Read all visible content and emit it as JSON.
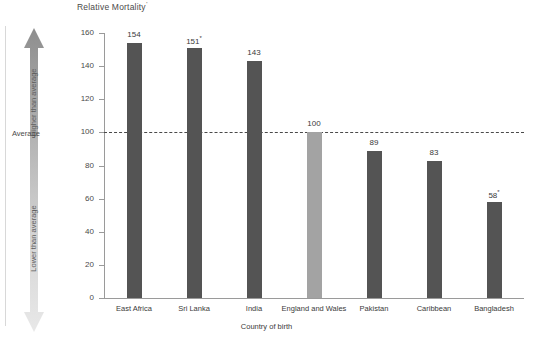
{
  "chart_data": {
    "type": "bar",
    "title": "Relative Mortality",
    "title_footnote_mark": "'",
    "xlabel": "Country of birth",
    "ylabel": "",
    "ylim": [
      0,
      160
    ],
    "ytick_step": 20,
    "yticks": [
      "160",
      "140",
      "120",
      "100",
      "80",
      "60",
      "40",
      "20",
      "0"
    ],
    "grid": false,
    "legend": "none",
    "categories": [
      "East Africa",
      "Sri Lanka",
      "India",
      "England and Wales",
      "Pakistan",
      "Caribbean",
      "Bangladesh"
    ],
    "values": [
      154,
      151,
      143,
      100,
      89,
      83,
      58
    ],
    "value_labels": [
      "154",
      "151",
      "143",
      "100",
      "89",
      "83",
      "58"
    ],
    "value_footnote_marks": [
      "",
      "*",
      "",
      "",
      "",
      "",
      "*"
    ],
    "highlight_index": 3,
    "reference_line": {
      "value": 100,
      "label": "Average",
      "style": "dashed"
    },
    "annotations": {
      "arrow_up_label": "Higher than average",
      "arrow_down_label": "Lower than average"
    },
    "colors": {
      "bar": "#545454",
      "bar_highlight": "#a3a3a3",
      "axis": "#9a9a9a",
      "text": "#3a3a3a",
      "reference_line": "#4a4a4a",
      "arrow_top": "#8e8e8e",
      "arrow_bottom": "#e2e2e2"
    }
  }
}
